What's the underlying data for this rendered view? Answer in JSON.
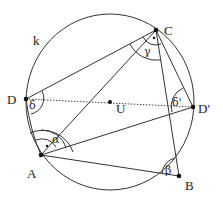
{
  "diagram": {
    "type": "geometry",
    "circle": {
      "label": "k",
      "center_label": "U"
    },
    "points": {
      "A": {
        "label": "A"
      },
      "B": {
        "label": "B"
      },
      "C": {
        "label": "C"
      },
      "D": {
        "label": "D"
      },
      "D_prime": {
        "label": "D'"
      },
      "U": {
        "label": "U"
      }
    },
    "angles": {
      "alpha": "α",
      "beta": "β",
      "gamma": "γ",
      "delta": "δ",
      "delta_prime": "δ'"
    },
    "segments": [
      "AB",
      "BC",
      "CD",
      "DA",
      "AC",
      "AD'",
      "CD'"
    ],
    "dashed_segments": [
      "DD'"
    ]
  }
}
